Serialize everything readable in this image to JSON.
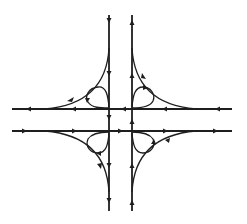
{
  "diagram": {
    "type": "cloverleaf-interchange",
    "canvas": {
      "width": 247,
      "height": 224
    },
    "colors": {
      "background": "#ffffff",
      "line": "#1e1e1e"
    },
    "roads": [
      {
        "id": "north-south-southbound",
        "orientation": "vertical",
        "x": 109,
        "y_start": 15,
        "y_end": 211,
        "direction": "down"
      },
      {
        "id": "north-south-northbound",
        "orientation": "vertical",
        "x": 132,
        "y_start": 15,
        "y_end": 211,
        "direction": "up"
      },
      {
        "id": "east-west-westbound",
        "orientation": "horizontal",
        "y": 109,
        "x_start": 12,
        "x_end": 232,
        "direction": "left"
      },
      {
        "id": "east-west-eastbound",
        "orientation": "horizontal",
        "y": 131,
        "x_start": 12,
        "x_end": 232,
        "direction": "right"
      }
    ],
    "outer_ramps": [
      {
        "quadrant": "top-left",
        "from": "southbound",
        "to": "westbound"
      },
      {
        "quadrant": "top-right",
        "from": "westbound",
        "to": "northbound"
      },
      {
        "quadrant": "bottom-left",
        "from": "eastbound",
        "to": "southbound"
      },
      {
        "quadrant": "bottom-right",
        "from": "northbound",
        "to": "eastbound"
      }
    ],
    "loop_ramps": [
      {
        "quadrant": "top-left"
      },
      {
        "quadrant": "top-right"
      },
      {
        "quadrant": "bottom-left"
      },
      {
        "quadrant": "bottom-right"
      }
    ],
    "labels": []
  }
}
